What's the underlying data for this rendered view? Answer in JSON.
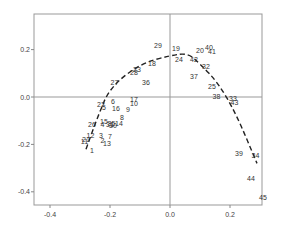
{
  "chart_data": {
    "type": "scatter",
    "title": "",
    "xlabel": "",
    "ylabel": "",
    "xlim": [
      -0.46,
      0.32
    ],
    "ylim": [
      -0.455,
      0.35
    ],
    "xticks": [
      "-0.4",
      "-0.2",
      "0.0",
      "0.2"
    ],
    "yticks": [
      "0.2",
      "0.0",
      "-0.2",
      "-0.4"
    ],
    "grid": false,
    "reference_lines": {
      "x": 0.0,
      "y": 0.0
    },
    "points": [
      {
        "label": "1",
        "x": -0.26,
        "y": -0.23
      },
      {
        "label": "2",
        "x": -0.225,
        "y": -0.185
      },
      {
        "label": "3",
        "x": -0.23,
        "y": -0.165
      },
      {
        "label": "4",
        "x": -0.225,
        "y": -0.12
      },
      {
        "label": "5",
        "x": -0.22,
        "y": -0.045
      },
      {
        "label": "6",
        "x": -0.19,
        "y": -0.02
      },
      {
        "label": "7",
        "x": -0.2,
        "y": -0.17
      },
      {
        "label": "8",
        "x": -0.16,
        "y": -0.09
      },
      {
        "label": "9",
        "x": -0.14,
        "y": -0.055
      },
      {
        "label": "10",
        "x": -0.12,
        "y": -0.03
      },
      {
        "label": "11",
        "x": -0.285,
        "y": -0.19
      },
      {
        "label": "12",
        "x": -0.265,
        "y": -0.165
      },
      {
        "label": "13",
        "x": -0.21,
        "y": -0.2
      },
      {
        "label": "14",
        "x": -0.17,
        "y": -0.115
      },
      {
        "label": "15",
        "x": -0.22,
        "y": -0.105
      },
      {
        "label": "16",
        "x": -0.18,
        "y": -0.05
      },
      {
        "label": "17",
        "x": -0.12,
        "y": -0.015
      },
      {
        "label": "18",
        "x": -0.06,
        "y": 0.14
      },
      {
        "label": "19",
        "x": 0.02,
        "y": 0.2
      },
      {
        "label": "20",
        "x": 0.1,
        "y": 0.195
      },
      {
        "label": "21",
        "x": -0.28,
        "y": -0.18
      },
      {
        "label": "22",
        "x": -0.23,
        "y": -0.035
      },
      {
        "label": "23",
        "x": -0.11,
        "y": 0.115
      },
      {
        "label": "24",
        "x": 0.03,
        "y": 0.155
      },
      {
        "label": "25",
        "x": 0.14,
        "y": 0.04
      },
      {
        "label": "26",
        "x": -0.26,
        "y": -0.12
      },
      {
        "label": "27",
        "x": -0.185,
        "y": 0.06
      },
      {
        "label": "28",
        "x": -0.12,
        "y": 0.1
      },
      {
        "label": "29",
        "x": -0.04,
        "y": 0.215
      },
      {
        "label": "30",
        "x": -0.19,
        "y": -0.125
      },
      {
        "label": "31",
        "x": -0.2,
        "y": -0.12
      },
      {
        "label": "32",
        "x": 0.12,
        "y": 0.125
      },
      {
        "label": "33",
        "x": 0.21,
        "y": -0.01
      },
      {
        "label": "34",
        "x": 0.285,
        "y": -0.25
      },
      {
        "label": "35",
        "x": -0.195,
        "y": -0.115
      },
      {
        "label": "36",
        "x": -0.08,
        "y": 0.06
      },
      {
        "label": "37",
        "x": 0.08,
        "y": 0.085
      },
      {
        "label": "38",
        "x": 0.155,
        "y": 0.0
      },
      {
        "label": "39",
        "x": 0.23,
        "y": -0.24
      },
      {
        "label": "40",
        "x": 0.13,
        "y": 0.205
      },
      {
        "label": "41",
        "x": 0.14,
        "y": 0.19
      },
      {
        "label": "42",
        "x": 0.08,
        "y": 0.155
      },
      {
        "label": "43",
        "x": 0.215,
        "y": -0.025
      },
      {
        "label": "44",
        "x": 0.27,
        "y": -0.345
      },
      {
        "label": "45",
        "x": 0.31,
        "y": -0.425
      }
    ],
    "fit_curve": {
      "style": "dashed",
      "points": [
        [
          -0.28,
          -0.22
        ],
        [
          -0.24,
          -0.08
        ],
        [
          -0.2,
          0.04
        ],
        [
          -0.1,
          0.14
        ],
        [
          0.0,
          0.175
        ],
        [
          0.06,
          0.185
        ],
        [
          0.1,
          0.14
        ],
        [
          0.16,
          0.06
        ],
        [
          0.22,
          -0.07
        ],
        [
          0.29,
          -0.28
        ]
      ]
    }
  }
}
